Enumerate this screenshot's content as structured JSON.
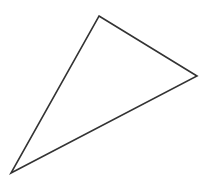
{
  "diagram": {
    "shape": "triangle",
    "width": 210,
    "height": 191,
    "background": "#ffffff",
    "stroke_color": "#333333",
    "stroke_width": 1.6,
    "fill": "none",
    "vertices": [
      {
        "name": "top",
        "x": 99,
        "y": 16
      },
      {
        "name": "right",
        "x": 197,
        "y": 76
      },
      {
        "name": "bottom-left",
        "x": 11,
        "y": 173
      }
    ]
  }
}
